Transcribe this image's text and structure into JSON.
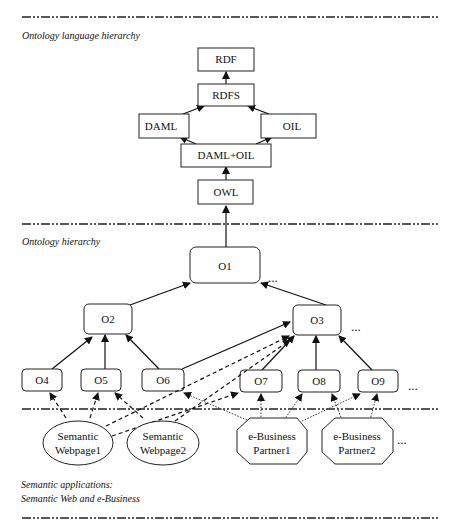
{
  "sections": {
    "language": "Ontology language hierarchy",
    "ontology": "Ontology hierarchy",
    "applications_line1": "Semantic applications:",
    "applications_line2": "Semantic Web and e-Business"
  },
  "language_nodes": {
    "rdf": "RDF",
    "rdfs": "RDFS",
    "daml": "DAML",
    "oil": "OIL",
    "damloil": "DAML+OIL",
    "owl": "OWL"
  },
  "ontology_nodes": {
    "o1": "O1",
    "o2": "O2",
    "o3": "O3",
    "o4": "O4",
    "o5": "O5",
    "o6": "O6",
    "o7": "O7",
    "o8": "O8",
    "o9": "O9"
  },
  "applications": {
    "webpage1": [
      "Semantic",
      "Webpage1"
    ],
    "webpage2": [
      "Semantic",
      "Webpage2"
    ],
    "partner1": [
      "e-Business",
      "Partner1"
    ],
    "partner2": [
      "e-Business",
      "Partner2"
    ]
  },
  "ellipsis": "..."
}
